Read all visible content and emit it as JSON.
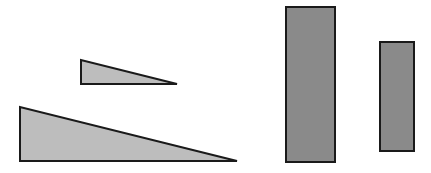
{
  "diagram": {
    "colors": {
      "triangle_fill": "#bdbdbd",
      "rect_fill": "#8a8a8a",
      "stroke": "#1a1a1a",
      "background": "#ffffff"
    },
    "shapes": [
      {
        "id": "small-triangle",
        "type": "right-triangle",
        "points": [
          [
            81,
            60
          ],
          [
            81,
            84
          ],
          [
            177,
            84
          ]
        ]
      },
      {
        "id": "large-triangle",
        "type": "right-triangle",
        "points": [
          [
            20,
            107
          ],
          [
            20,
            161
          ],
          [
            237,
            161
          ]
        ]
      },
      {
        "id": "tall-rectangle",
        "type": "rectangle",
        "x": 286,
        "y": 7,
        "width": 49,
        "height": 155
      },
      {
        "id": "short-rectangle",
        "type": "rectangle",
        "x": 380,
        "y": 42,
        "width": 34,
        "height": 109
      }
    ]
  }
}
